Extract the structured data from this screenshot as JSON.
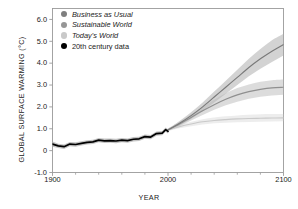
{
  "chart_data": {
    "type": "line",
    "title": "",
    "xlabel": "YEAR",
    "ylabel": "GLOBAL SURFACE WARMING (°C)",
    "xlim": [
      1900,
      2100
    ],
    "ylim": [
      -1.0,
      6.5
    ],
    "grid": false,
    "legend_position": "top-left",
    "xticks": [
      {
        "value": 1900,
        "label": "1900"
      },
      {
        "value": 2000,
        "label": "2000"
      },
      {
        "value": 2100,
        "label": "2100"
      }
    ],
    "xminorticks": [
      1920,
      1940,
      1960,
      1980,
      2020,
      2040,
      2060,
      2080
    ],
    "yticks": [
      {
        "value": 6.0,
        "label": "6.0"
      },
      {
        "value": 5.0,
        "label": "5.0"
      },
      {
        "value": 4.0,
        "label": "4.0"
      },
      {
        "value": 3.0,
        "label": "3.0"
      },
      {
        "value": 2.0,
        "label": "2.0"
      },
      {
        "value": 1.0,
        "label": "1.0"
      },
      {
        "value": 0.0,
        "label": "0"
      },
      {
        "value": -1.0,
        "label": "-1.0"
      }
    ],
    "series": [
      {
        "name": "Business as Usual",
        "color": "#7a7a7a",
        "band_color": "#b8b8b8",
        "x": [
          2000,
          2010,
          2020,
          2030,
          2040,
          2050,
          2060,
          2070,
          2080,
          2090,
          2100
        ],
        "values": [
          0.95,
          1.25,
          1.6,
          2.0,
          2.45,
          2.9,
          3.35,
          3.8,
          4.2,
          4.55,
          4.85
        ],
        "band_low": [
          0.9,
          1.15,
          1.45,
          1.8,
          2.2,
          2.6,
          3.0,
          3.4,
          3.75,
          4.05,
          4.35
        ],
        "band_high": [
          1.0,
          1.35,
          1.75,
          2.2,
          2.7,
          3.2,
          3.7,
          4.2,
          4.65,
          5.05,
          5.35
        ]
      },
      {
        "name": "Sustainable World",
        "color": "#8f8f8f",
        "band_color": "#c6c6c6",
        "x": [
          2000,
          2010,
          2020,
          2030,
          2040,
          2050,
          2060,
          2070,
          2080,
          2090,
          2100
        ],
        "values": [
          0.95,
          1.22,
          1.52,
          1.82,
          2.1,
          2.35,
          2.55,
          2.7,
          2.8,
          2.87,
          2.9
        ],
        "band_low": [
          0.9,
          1.12,
          1.38,
          1.63,
          1.87,
          2.07,
          2.24,
          2.37,
          2.46,
          2.52,
          2.55
        ],
        "band_high": [
          1.0,
          1.32,
          1.66,
          2.0,
          2.33,
          2.62,
          2.86,
          3.03,
          3.15,
          3.22,
          3.25
        ]
      },
      {
        "name": "Today's World",
        "color": "#c9c9c9",
        "band_color": "#e2e2e2",
        "x": [
          2000,
          2010,
          2020,
          2030,
          2040,
          2050,
          2060,
          2070,
          2080,
          2090,
          2100
        ],
        "values": [
          0.95,
          1.1,
          1.22,
          1.32,
          1.38,
          1.42,
          1.45,
          1.47,
          1.48,
          1.49,
          1.5
        ],
        "band_low": [
          0.9,
          1.02,
          1.12,
          1.2,
          1.25,
          1.28,
          1.3,
          1.31,
          1.32,
          1.33,
          1.34
        ],
        "band_high": [
          1.0,
          1.18,
          1.32,
          1.44,
          1.52,
          1.57,
          1.61,
          1.64,
          1.66,
          1.67,
          1.68
        ]
      },
      {
        "name": "20th century data",
        "color": "#000000",
        "band_color": "#b0b0b0",
        "x": [
          1900,
          1905,
          1910,
          1915,
          1920,
          1925,
          1930,
          1935,
          1940,
          1945,
          1950,
          1955,
          1960,
          1965,
          1970,
          1975,
          1980,
          1985,
          1990,
          1995,
          1998,
          2000
        ],
        "values": [
          0.3,
          0.22,
          0.18,
          0.3,
          0.28,
          0.33,
          0.38,
          0.4,
          0.48,
          0.45,
          0.46,
          0.44,
          0.48,
          0.46,
          0.52,
          0.54,
          0.64,
          0.62,
          0.78,
          0.8,
          0.96,
          0.88
        ],
        "band_low": [
          0.18,
          0.12,
          0.08,
          0.2,
          0.18,
          0.23,
          0.28,
          0.3,
          0.38,
          0.35,
          0.36,
          0.34,
          0.38,
          0.36,
          0.42,
          0.44,
          0.54,
          0.52,
          0.68,
          0.7,
          0.86,
          0.78
        ],
        "band_high": [
          0.42,
          0.32,
          0.28,
          0.4,
          0.38,
          0.43,
          0.48,
          0.5,
          0.58,
          0.55,
          0.56,
          0.54,
          0.58,
          0.56,
          0.62,
          0.64,
          0.74,
          0.72,
          0.88,
          0.9,
          1.06,
          0.98
        ]
      }
    ]
  },
  "legend": {
    "items": [
      {
        "label": "Business as Usual",
        "marker_color": "#7f7f7f",
        "italic": true
      },
      {
        "label": "Sustainable World",
        "marker_color": "#969696",
        "italic": true
      },
      {
        "label": "Today's World",
        "marker_color": "#c9c9c9",
        "italic": true
      },
      {
        "label": "20th century data",
        "marker_color": "#000000",
        "italic": false
      }
    ]
  },
  "axes": {
    "frame_color": "#9a9a9a",
    "tick_color": "#9a9a9a",
    "text_color": "#1a1a1a"
  }
}
